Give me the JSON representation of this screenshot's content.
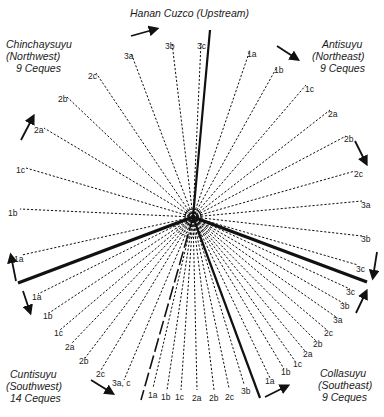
{
  "title": "Hanan Cuzco (Upstream)",
  "regions": {
    "chinchaysuyu": {
      "name": "Chinchaysuyu",
      "direction": "(Northwest)",
      "count": "9 Ceques"
    },
    "antisuyu": {
      "name": "Antisuyu",
      "direction": "(Northeast)",
      "count": "9 Ceques"
    },
    "collasuyu": {
      "name": "Collasuyu",
      "direction": "(Southeast)",
      "count": "9 Ceques"
    },
    "cuntisuyu": {
      "name": "Cuntisuyu",
      "direction": "(Southwest)",
      "count": "14 Ceques"
    }
  },
  "center": {
    "x": 193,
    "y": 217
  },
  "colors": {
    "line": "#111111",
    "text": "#1a1a1a",
    "background": "#ffffff"
  },
  "boundaries": [
    {
      "name": "north-boundary",
      "x": 210,
      "y": 30,
      "style": "solid"
    },
    {
      "name": "west-boundary",
      "x": 18,
      "y": 283,
      "style": "solid"
    },
    {
      "name": "east-boundary",
      "x": 367,
      "y": 282,
      "style": "solid"
    },
    {
      "name": "south-boundary",
      "x": 260,
      "y": 398,
      "style": "solid"
    },
    {
      "name": "southwest-split",
      "x": 141,
      "y": 400,
      "style": "long-dash"
    }
  ],
  "ceques": {
    "chinchaysuyu": [
      {
        "label": "1a",
        "x": 22,
        "y": 255
      },
      {
        "label": "1b",
        "x": 20,
        "y": 209
      },
      {
        "label": "1c",
        "x": 26,
        "y": 168
      },
      {
        "label": "2a",
        "x": 44,
        "y": 128
      },
      {
        "label": "2b",
        "x": 67,
        "y": 97
      },
      {
        "label": "2c",
        "x": 96,
        "y": 73
      },
      {
        "label": "3a",
        "x": 131,
        "y": 53
      },
      {
        "label": "3b",
        "x": 172,
        "y": 43
      },
      {
        "label": "3c",
        "x": 201,
        "y": 43
      }
    ],
    "antisuyu": [
      {
        "label": "1a",
        "x": 250,
        "y": 50
      },
      {
        "label": "1b",
        "x": 277,
        "y": 67
      },
      {
        "label": "1c",
        "x": 306,
        "y": 85
      },
      {
        "label": "2a",
        "x": 330,
        "y": 110
      },
      {
        "label": "2b",
        "x": 346,
        "y": 136
      },
      {
        "label": "2c",
        "x": 355,
        "y": 171
      },
      {
        "label": "3a",
        "x": 362,
        "y": 201
      },
      {
        "label": "3b",
        "x": 362,
        "y": 236
      },
      {
        "label": "3c",
        "x": 358,
        "y": 265
      }
    ],
    "collasuyu": [
      {
        "label": "3c",
        "x": 350,
        "y": 289
      },
      {
        "label": "3b",
        "x": 343,
        "y": 303
      },
      {
        "label": "3a",
        "x": 336,
        "y": 317
      },
      {
        "label": "2c",
        "x": 327,
        "y": 330
      },
      {
        "label": "2b",
        "x": 316,
        "y": 341
      },
      {
        "label": "2a",
        "x": 305,
        "y": 351
      },
      {
        "label": "1c",
        "x": 295,
        "y": 361
      },
      {
        "label": "1b",
        "x": 284,
        "y": 369
      },
      {
        "label": "1a",
        "x": 270,
        "y": 378
      }
    ],
    "cuntisuyu": [
      {
        "label": "1a",
        "x": 38,
        "y": 294
      },
      {
        "label": "1b",
        "x": 49,
        "y": 313
      },
      {
        "label": "1c",
        "x": 60,
        "y": 330
      },
      {
        "label": "2a",
        "x": 71,
        "y": 344
      },
      {
        "label": "2b",
        "x": 85,
        "y": 358
      },
      {
        "label": "2c",
        "x": 101,
        "y": 370
      },
      {
        "label": "3a, c",
        "x": 124,
        "y": 380
      },
      {
        "label": "1a",
        "x": 153,
        "y": 388
      },
      {
        "label": "1b",
        "x": 167,
        "y": 390
      },
      {
        "label": "1c",
        "x": 181,
        "y": 390
      },
      {
        "label": "2a",
        "x": 197,
        "y": 390
      },
      {
        "label": "2b",
        "x": 214,
        "y": 390
      },
      {
        "label": "2c",
        "x": 229,
        "y": 388
      },
      {
        "label": "3b",
        "x": 244,
        "y": 384
      }
    ]
  },
  "ceque_labels": {
    "chinchaysuyu": [
      {
        "text": "1a",
        "x": 14,
        "y": 259
      },
      {
        "text": "1b",
        "x": 8,
        "y": 213
      },
      {
        "text": "1c",
        "x": 16,
        "y": 170
      },
      {
        "text": "2a",
        "x": 34,
        "y": 130
      },
      {
        "text": "2b",
        "x": 58,
        "y": 99
      },
      {
        "text": "2c",
        "x": 88,
        "y": 76
      },
      {
        "text": "3a",
        "x": 124,
        "y": 56
      },
      {
        "text": "3b",
        "x": 165,
        "y": 46
      },
      {
        "text": "3c",
        "x": 197,
        "y": 46
      }
    ],
    "antisuyu": [
      {
        "text": "1a",
        "x": 247,
        "y": 54
      },
      {
        "text": "1b",
        "x": 274,
        "y": 70
      },
      {
        "text": "1c",
        "x": 305,
        "y": 89
      },
      {
        "text": "2a",
        "x": 328,
        "y": 114
      },
      {
        "text": "2b",
        "x": 344,
        "y": 139
      },
      {
        "text": "2c",
        "x": 354,
        "y": 174
      },
      {
        "text": "3a",
        "x": 361,
        "y": 205
      },
      {
        "text": "3b",
        "x": 361,
        "y": 239
      },
      {
        "text": "3c",
        "x": 356,
        "y": 269
      }
    ],
    "collasuyu": [
      {
        "text": "3c",
        "x": 346,
        "y": 292
      },
      {
        "text": "3b",
        "x": 340,
        "y": 306
      },
      {
        "text": "3a",
        "x": 333,
        "y": 320
      },
      {
        "text": "2c",
        "x": 324,
        "y": 333
      },
      {
        "text": "2b",
        "x": 313,
        "y": 344
      },
      {
        "text": "2a",
        "x": 303,
        "y": 354
      },
      {
        "text": "1c",
        "x": 293,
        "y": 364
      },
      {
        "text": "1b",
        "x": 281,
        "y": 372
      },
      {
        "text": "1a",
        "x": 265,
        "y": 381
      }
    ],
    "cuntisuyu": [
      {
        "text": "1a",
        "x": 32,
        "y": 297
      },
      {
        "text": "1b",
        "x": 43,
        "y": 316
      },
      {
        "text": "1c",
        "x": 54,
        "y": 333
      },
      {
        "text": "2a",
        "x": 65,
        "y": 347
      },
      {
        "text": "2b",
        "x": 79,
        "y": 361
      },
      {
        "text": "2c",
        "x": 96,
        "y": 374
      },
      {
        "text": "3a, c",
        "x": 112,
        "y": 383
      },
      {
        "text": "1a",
        "x": 148,
        "y": 395
      },
      {
        "text": "1b",
        "x": 161,
        "y": 397
      },
      {
        "text": "1c",
        "x": 175,
        "y": 397
      },
      {
        "text": "2a",
        "x": 192,
        "y": 398
      },
      {
        "text": "2b",
        "x": 209,
        "y": 398
      },
      {
        "text": "2c",
        "x": 225,
        "y": 397
      },
      {
        "text": "3b",
        "x": 241,
        "y": 391
      }
    ]
  },
  "arrows": [
    {
      "name": "arrow-north",
      "x1": 131,
      "y1": 36,
      "x2": 156,
      "y2": 29
    },
    {
      "name": "arrow-northeast",
      "x1": 277,
      "y1": 46,
      "x2": 297,
      "y2": 59
    },
    {
      "name": "arrow-northwest",
      "x1": 21,
      "y1": 60,
      "x2": 33,
      "y2": 37,
      "offset_y": 80
    },
    {
      "name": "arrow-east-upper",
      "x1": 350,
      "y1": 143,
      "x2": 358,
      "y2": 160
    },
    {
      "name": "arrow-east-lower",
      "x1": 372,
      "y1": 253,
      "x2": 369,
      "y2": 282
    },
    {
      "name": "arrow-southeast-up",
      "x1": 357,
      "y1": 315,
      "x2": 367,
      "y2": 292
    },
    {
      "name": "arrow-west-up",
      "x1": 16,
      "y1": 281,
      "x2": 10,
      "y2": 255
    },
    {
      "name": "arrow-west-down",
      "x1": 23,
      "y1": 291,
      "x2": 31,
      "y2": 312
    },
    {
      "name": "arrow-southwest",
      "x1": 91,
      "y1": 381,
      "x2": 112,
      "y2": 393
    },
    {
      "name": "arrow-south",
      "x1": 265,
      "y1": 397,
      "x2": 287,
      "y2": 386
    }
  ]
}
